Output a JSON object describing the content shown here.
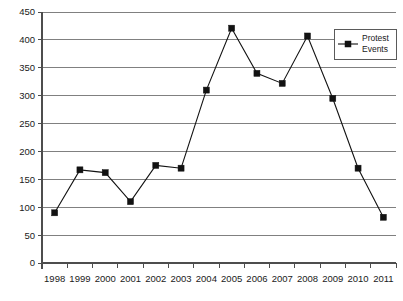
{
  "chart_data": {
    "type": "line",
    "title": "",
    "xlabel": "",
    "ylabel": "",
    "grid": true,
    "legend_position": "top-right",
    "legend_entries": [
      "Protest Events"
    ],
    "legend_label_line1": "Protest",
    "legend_label_line2": "Events",
    "marker": "square",
    "series_name": "Protest Events",
    "categories": [
      "1998",
      "1999",
      "2000",
      "2001",
      "2002",
      "2003",
      "2004",
      "2005",
      "2006",
      "2007",
      "2008",
      "2009",
      "2010",
      "2011"
    ],
    "values": [
      90,
      167,
      162,
      110,
      175,
      170,
      310,
      421,
      340,
      322,
      407,
      295,
      170,
      82
    ],
    "x": [
      "1998",
      "1999",
      "2000",
      "2001",
      "2002",
      "2003",
      "2004",
      "2005",
      "2006",
      "2007",
      "2008",
      "2009",
      "2010",
      "2011"
    ],
    "ylim": [
      0,
      450
    ],
    "yticks": [
      0,
      50,
      100,
      150,
      200,
      250,
      300,
      350,
      400,
      450
    ],
    "ytick_labels": [
      "0",
      "50",
      "100",
      "150",
      "200",
      "250",
      "300",
      "350",
      "400",
      "450"
    ],
    "xtick_labels": [
      "1998",
      "1999",
      "2000",
      "2001",
      "2002",
      "2003",
      "2004",
      "2005",
      "2006",
      "2007",
      "2008",
      "2009",
      "2010",
      "2011"
    ],
    "colors": {
      "line": "#121212",
      "marker": "#121212",
      "grid": "#808080",
      "axis": "#4d4d4d",
      "background": "#ffffff",
      "text": "#1a1a1a"
    }
  }
}
